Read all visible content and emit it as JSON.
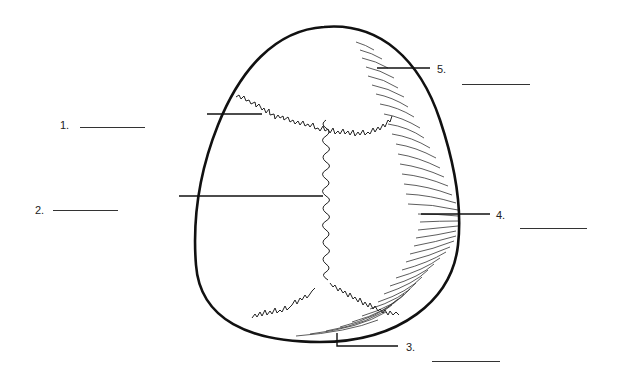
{
  "diagram": {
    "colors": {
      "ink": "#111111",
      "label": "#222222",
      "blank": "#333333",
      "background": "#ffffff"
    },
    "labels": [
      {
        "id": 1,
        "text": "1.",
        "x": 60,
        "y": 120,
        "blank": {
          "x": 80,
          "y": 127,
          "w": 65
        }
      },
      {
        "id": 2,
        "text": "2.",
        "x": 35,
        "y": 205,
        "blank": {
          "x": 53,
          "y": 210,
          "w": 65
        }
      },
      {
        "id": 3,
        "text": "3.",
        "x": 406,
        "y": 343,
        "blank": {
          "x": 432,
          "y": 361,
          "w": 68
        }
      },
      {
        "id": 4,
        "text": "4.",
        "x": 496,
        "y": 211,
        "blank": {
          "x": 520,
          "y": 228,
          "w": 67
        }
      },
      {
        "id": 5,
        "text": "5.",
        "x": 437,
        "y": 65,
        "blank": {
          "x": 462,
          "y": 84,
          "w": 68
        }
      }
    ]
  }
}
